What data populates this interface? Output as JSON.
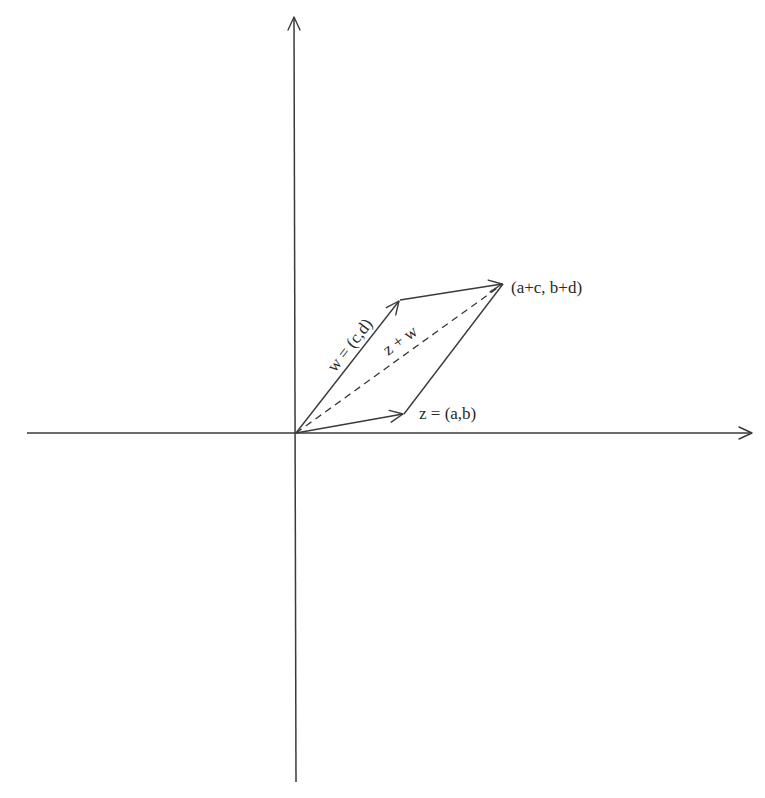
{
  "figure": {
    "colors": {
      "background": "#ffffff",
      "line": "#3a3a3a",
      "text": "#2a2a2a"
    },
    "axes": {
      "origin": [
        296,
        433
      ],
      "x_axis": {
        "start": [
          27,
          433
        ],
        "end": [
          753,
          433
        ],
        "arrow": true
      },
      "y_axis": {
        "start": [
          296,
          782
        ],
        "end": [
          293,
          16
        ],
        "arrow": true
      }
    },
    "points": {
      "origin": [
        296,
        433
      ],
      "z_tip": [
        404,
        414
      ],
      "w_tip": [
        400,
        300
      ],
      "sum_tip": [
        503,
        284
      ]
    },
    "vectors": [
      {
        "name": "z",
        "from": "origin",
        "to": "z_tip",
        "style": "solid",
        "arrow": true
      },
      {
        "name": "w",
        "from": "origin",
        "to": "w_tip",
        "style": "solid",
        "arrow": true
      },
      {
        "name": "w-translated",
        "from": "w_tip",
        "to": "sum_tip",
        "style": "solid",
        "arrow": true
      },
      {
        "name": "z-translated",
        "from": "z_tip",
        "to": "sum_tip",
        "style": "solid",
        "arrow": false
      },
      {
        "name": "z+w",
        "from": "origin",
        "to": "sum_tip",
        "style": "dashed",
        "arrow": false
      }
    ],
    "labels": {
      "z": "z = (a,b)",
      "w": "w = (c,d)",
      "sum_vector": "z + w",
      "sum_point": "(a+c, b+d)"
    }
  }
}
